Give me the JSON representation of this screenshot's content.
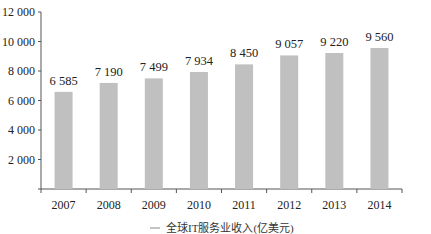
{
  "chart_data": {
    "type": "bar",
    "title": "",
    "xlabel": "",
    "ylabel": "",
    "categories": [
      "2007",
      "2008",
      "2009",
      "2010",
      "2011",
      "2012",
      "2013",
      "2014"
    ],
    "series": [
      {
        "name": "全球IT服务业收入(亿美元)",
        "values": [
          6585,
          7190,
          7499,
          7934,
          8450,
          9057,
          9220,
          9560
        ],
        "value_labels": [
          "6 585",
          "7 190",
          "7 499",
          "7 934",
          "8 450",
          "9 057",
          "9 220",
          "9 560"
        ],
        "color": "#c0c0c0"
      }
    ],
    "ylim": [
      0,
      12000
    ],
    "yticks": [
      0,
      2000,
      4000,
      6000,
      8000,
      10000,
      12000
    ],
    "ytick_labels": [
      "",
      "2 000",
      "4 000",
      "6 000",
      "8 000",
      "10 000",
      "12 000"
    ],
    "grid": false,
    "legend_position": "bottom"
  },
  "legend": {
    "label": "全球IT服务业收入(亿美元)"
  }
}
